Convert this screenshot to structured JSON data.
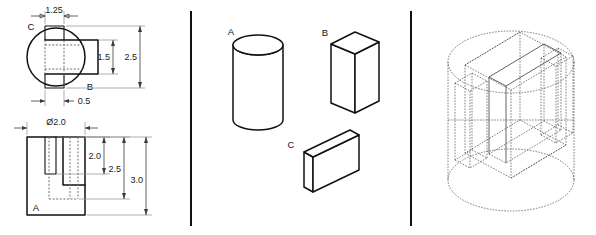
{
  "figure": {
    "panels": [
      {
        "name": "orthographic-views",
        "label": "left"
      },
      {
        "name": "component-solids",
        "label": "middle"
      },
      {
        "name": "isometric-assembly",
        "label": "right"
      }
    ]
  },
  "panel_left": {
    "name": "orthographic-views",
    "top_view": {
      "name": "top-view",
      "part_labels": [
        {
          "id": "C",
          "text": "C"
        },
        {
          "id": "B",
          "text": "B"
        }
      ],
      "dimensions": [
        {
          "id": "width-rib",
          "text": "1.25",
          "orientation": "horizontal"
        },
        {
          "id": "height-inner",
          "text": "1.5",
          "orientation": "vertical"
        },
        {
          "id": "height-outer",
          "text": "2.5",
          "orientation": "vertical"
        },
        {
          "id": "offset-left",
          "text": "0.5",
          "orientation": "horizontal"
        }
      ]
    },
    "front_view": {
      "name": "front-view",
      "part_labels": [
        {
          "id": "A",
          "text": "A"
        }
      ],
      "dimensions": [
        {
          "id": "diameter",
          "text": "Ø2.0",
          "orientation": "horizontal"
        },
        {
          "id": "height-slot",
          "text": "2.0",
          "orientation": "vertical"
        },
        {
          "id": "height-mid",
          "text": "2.5",
          "orientation": "vertical"
        },
        {
          "id": "height-total",
          "text": "3.0",
          "orientation": "vertical"
        }
      ]
    }
  },
  "panel_middle": {
    "name": "component-solids",
    "solids": [
      {
        "id": "A",
        "text": "A",
        "shape": "cylinder"
      },
      {
        "id": "B",
        "text": "B",
        "shape": "rectangular-prism"
      },
      {
        "id": "C",
        "text": "C",
        "shape": "flat-plate"
      }
    ]
  },
  "panel_right": {
    "name": "isometric-assembly",
    "description": "Wireframe isometric of cylinder combined with two prisms",
    "labels": []
  },
  "style": {
    "background": "#ffffff",
    "object_line_color": "#111111",
    "hidden_line_color": "#6f6f6f",
    "dimension_line_color": "#3a3a3a",
    "wireframe_color": "#555555",
    "divider_color": "#111111"
  }
}
